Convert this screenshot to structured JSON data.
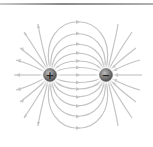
{
  "diagram": {
    "positive_charge": {
      "symbol": "+",
      "cx": 50,
      "cy": 75,
      "r": 6
    },
    "negative_charge": {
      "symbol": "−",
      "cx": 106,
      "cy": 75,
      "r": 6
    },
    "colors": {
      "field_line": "#c4c4c4",
      "charge_fill": "#777777",
      "charge_glow": "#ffffff",
      "top_rule": "#8a8a8a"
    },
    "field_line_count_closed": 9,
    "outward_lines_left": 9,
    "inward_lines_right": 9
  }
}
